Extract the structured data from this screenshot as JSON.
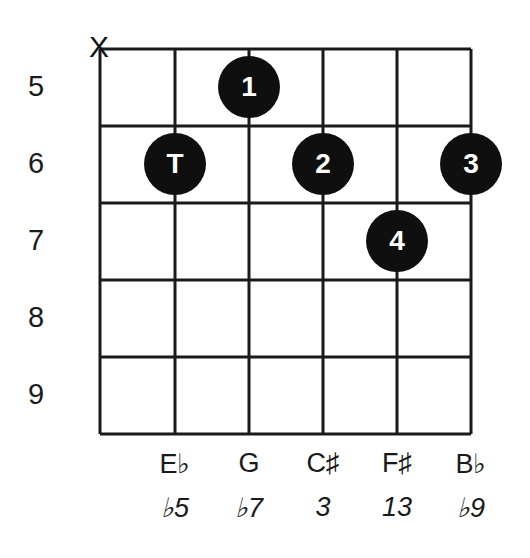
{
  "diagram": {
    "type": "guitar chord fretboard diagram",
    "grid": {
      "strings": 6,
      "frets_shown": 5,
      "left": 100,
      "top": 49,
      "right": 471,
      "bottom": 434,
      "line_color": "#1a1a1a"
    },
    "mute_marker": {
      "string": 1,
      "symbol": "X"
    },
    "fret_numbers": [
      "5",
      "6",
      "7",
      "8",
      "9"
    ],
    "dots": [
      {
        "label": "1",
        "string": 3,
        "fret": 5
      },
      {
        "label": "T",
        "string": 2,
        "fret": 6
      },
      {
        "label": "2",
        "string": 4,
        "fret": 6
      },
      {
        "label": "3",
        "string": 6,
        "fret": 6
      },
      {
        "label": "4",
        "string": 5,
        "fret": 7
      }
    ],
    "notes": [
      "E♭",
      "G",
      "C♯",
      "F♯",
      "B♭"
    ],
    "intervals": [
      "♭5",
      "♭7",
      "3",
      "13",
      "♭9"
    ],
    "dot_color": "#0f0f0f",
    "dot_text_color": "#ffffff"
  }
}
